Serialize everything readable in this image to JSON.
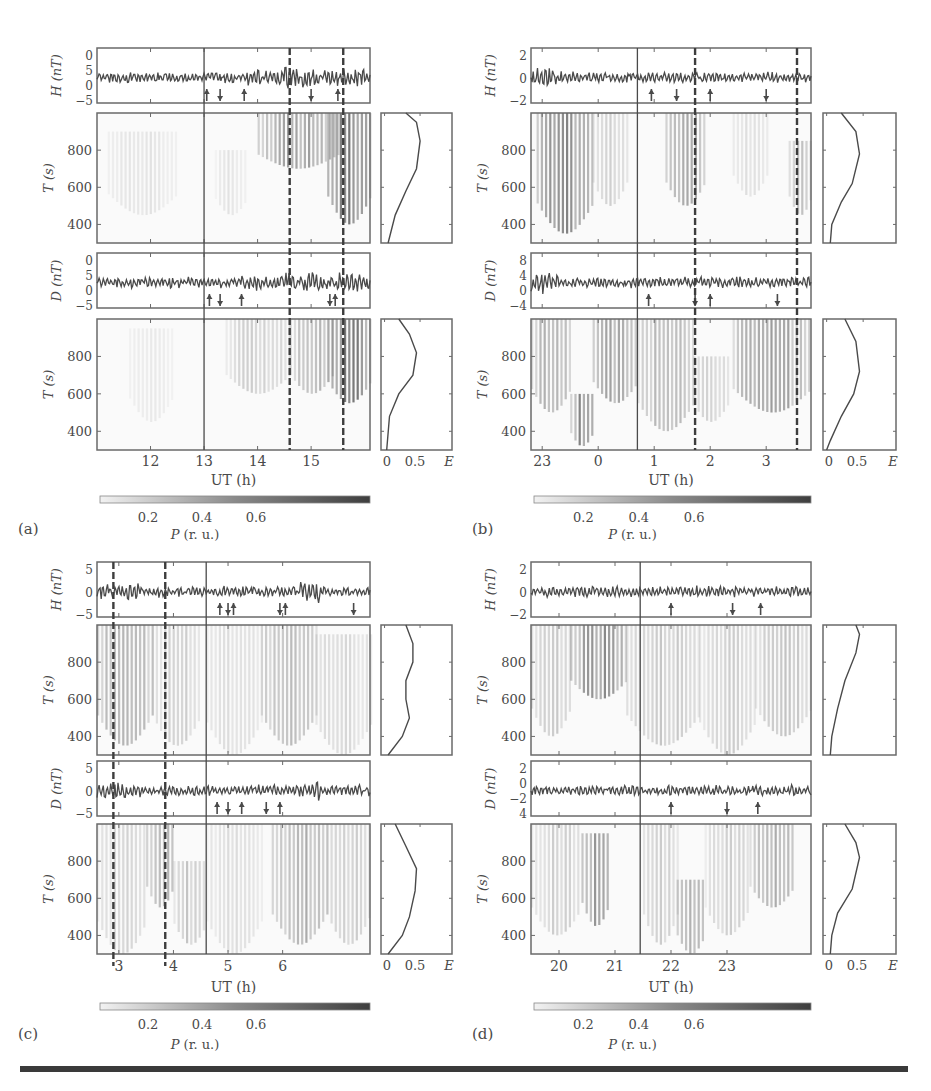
{
  "figure": {
    "caption_visible": "",
    "colors": {
      "axis": "#6a6a6a",
      "trace": "#4a4a4a",
      "dashed": "#3d3d3d",
      "spec_dark": "#555555",
      "spec_light": "#f2f2f2",
      "rule": "#3a3a3a"
    }
  },
  "chart_data": [
    {
      "panel": "a",
      "type": "heatmap",
      "label": "(a)",
      "h_strip": {
        "ylabel": "H (nT)",
        "yticks": [
          "0",
          "5",
          "0",
          "−5"
        ]
      },
      "d_strip": {
        "ylabel": "D (nT)",
        "yticks": [
          "0",
          "5",
          "0",
          "−5"
        ]
      },
      "spectrogram": {
        "ylabel": "T (s)",
        "yticks": [
          800,
          600,
          400
        ],
        "ylim": [
          300,
          1000
        ]
      },
      "xlabel": "UT (h)",
      "xticks": [
        "12",
        "13",
        "14",
        "15"
      ],
      "xrange": [
        11.0,
        16.1
      ],
      "xtick_values": [
        12,
        13,
        14,
        15
      ],
      "solid_line": 13.0,
      "dashed_lines": [
        14.6,
        15.6
      ],
      "arrows_H": [
        {
          "x": 13.05,
          "dir": "up"
        },
        {
          "x": 13.3,
          "dir": "down"
        },
        {
          "x": 13.75,
          "dir": "up"
        },
        {
          "x": 15.0,
          "dir": "down"
        },
        {
          "x": 15.5,
          "dir": "up"
        }
      ],
      "arrows_D": [
        {
          "x": 13.1,
          "dir": "up"
        },
        {
          "x": 13.3,
          "dir": "down"
        },
        {
          "x": 13.7,
          "dir": "up"
        },
        {
          "x": 15.35,
          "dir": "down"
        },
        {
          "x": 15.45,
          "dir": "up"
        }
      ],
      "E_profile_1": {
        "xticks": [
          "0",
          "0.5",
          "E"
        ],
        "curve": [
          [
            0.35,
            1000
          ],
          [
            0.5,
            950
          ],
          [
            0.55,
            850
          ],
          [
            0.5,
            700
          ],
          [
            0.35,
            580
          ],
          [
            0.2,
            450
          ],
          [
            0.1,
            300
          ]
        ]
      },
      "E_profile_2": {
        "xticks": [
          "0",
          "0.5",
          "E"
        ],
        "curve": [
          [
            0.25,
            1000
          ],
          [
            0.4,
            920
          ],
          [
            0.5,
            820
          ],
          [
            0.45,
            700
          ],
          [
            0.25,
            600
          ],
          [
            0.12,
            480
          ],
          [
            0.08,
            300
          ]
        ]
      },
      "colorbar": {
        "label": "P (r. u.)",
        "ticks": [
          "0.2",
          "0.4",
          "0.6"
        ]
      },
      "spec1_blobs": [
        [
          14.0,
          15.5,
          700,
          1000,
          0.6
        ],
        [
          15.3,
          16.1,
          400,
          1000,
          0.85
        ],
        [
          11.2,
          12.5,
          450,
          900,
          0.15
        ],
        [
          13.2,
          13.8,
          450,
          800,
          0.15
        ]
      ],
      "spec2_blobs": [
        [
          13.4,
          14.6,
          600,
          1000,
          0.3
        ],
        [
          14.6,
          15.4,
          600,
          1000,
          0.45
        ],
        [
          15.3,
          16.1,
          550,
          1000,
          0.9
        ],
        [
          11.6,
          12.4,
          450,
          950,
          0.12
        ]
      ]
    },
    {
      "panel": "b",
      "type": "heatmap",
      "label": "(b)",
      "h_strip": {
        "ylabel": "H (nT)",
        "yticks": [
          "2",
          "0",
          "−2"
        ]
      },
      "d_strip": {
        "ylabel": "D (nT)",
        "yticks": [
          "8",
          "4",
          "0",
          "−4"
        ]
      },
      "spectrogram": {
        "ylabel": "T (s)",
        "yticks": [
          800,
          600,
          400
        ],
        "ylim": [
          300,
          1000
        ]
      },
      "xlabel": "UT (h)",
      "xticks": [
        "23",
        "0",
        "1",
        "2",
        "3"
      ],
      "xrange": [
        22.8,
        27.8
      ],
      "xtick_values": [
        23,
        24,
        25,
        26,
        27
      ],
      "solid_line": 24.7,
      "dashed_lines": [
        25.73,
        27.55
      ],
      "arrows_H": [
        {
          "x": 24.95,
          "dir": "up"
        },
        {
          "x": 25.4,
          "dir": "down"
        },
        {
          "x": 26.0,
          "dir": "up"
        },
        {
          "x": 27.0,
          "dir": "down"
        }
      ],
      "arrows_D": [
        {
          "x": 24.9,
          "dir": "up"
        },
        {
          "x": 25.73,
          "dir": "down"
        },
        {
          "x": 26.0,
          "dir": "up"
        },
        {
          "x": 27.2,
          "dir": "down"
        }
      ],
      "E_profile_1": {
        "xticks": [
          "0",
          "0.5",
          "E"
        ],
        "curve": [
          [
            0.25,
            1000
          ],
          [
            0.45,
            900
          ],
          [
            0.5,
            780
          ],
          [
            0.4,
            620
          ],
          [
            0.25,
            520
          ],
          [
            0.12,
            400
          ],
          [
            0.1,
            300
          ]
        ]
      },
      "E_profile_2": {
        "xticks": [
          "0",
          "0.5",
          "E"
        ],
        "curve": [
          [
            0.3,
            1000
          ],
          [
            0.45,
            880
          ],
          [
            0.5,
            720
          ],
          [
            0.42,
            600
          ],
          [
            0.25,
            480
          ],
          [
            0.1,
            350
          ],
          [
            0.05,
            300
          ]
        ]
      },
      "colorbar": {
        "label": "P (r. u.)",
        "ticks": [
          "0.2",
          "0.4",
          "0.6"
        ]
      },
      "spec1_blobs": [
        [
          22.9,
          23.9,
          350,
          1000,
          0.75
        ],
        [
          23.9,
          24.5,
          500,
          1000,
          0.3
        ],
        [
          25.2,
          25.9,
          500,
          1000,
          0.55
        ],
        [
          26.4,
          27.0,
          550,
          1000,
          0.2
        ],
        [
          27.4,
          27.8,
          450,
          850,
          0.45
        ]
      ],
      "spec2_blobs": [
        [
          22.8,
          23.5,
          500,
          1000,
          0.55
        ],
        [
          23.5,
          23.9,
          320,
          600,
          0.8
        ],
        [
          23.9,
          24.7,
          550,
          1000,
          0.6
        ],
        [
          24.7,
          25.7,
          400,
          1000,
          0.45
        ],
        [
          25.7,
          26.3,
          450,
          800,
          0.3
        ],
        [
          26.4,
          27.8,
          500,
          1000,
          0.6
        ]
      ]
    },
    {
      "panel": "c",
      "type": "heatmap",
      "label": "(c)",
      "h_strip": {
        "ylabel": "H (nT)",
        "yticks": [
          "5",
          "0",
          "−5"
        ]
      },
      "d_strip": {
        "ylabel": "D (nT)",
        "yticks": [
          "5",
          "0",
          "−5"
        ]
      },
      "spectrogram": {
        "ylabel": "T (s)",
        "yticks": [
          800,
          600,
          400
        ],
        "ylim": [
          300,
          1000
        ]
      },
      "xlabel": "UT (h)",
      "xticks": [
        "3",
        "4",
        "5",
        "6"
      ],
      "xrange": [
        2.6,
        7.6
      ],
      "xtick_values": [
        3,
        4,
        5,
        6
      ],
      "solid_line": 4.6,
      "dashed_lines": [
        2.9,
        3.85
      ],
      "arrows_H": [
        {
          "x": 4.85,
          "dir": "up"
        },
        {
          "x": 5.0,
          "dir": "down"
        },
        {
          "x": 5.1,
          "dir": "up"
        },
        {
          "x": 5.95,
          "dir": "down"
        },
        {
          "x": 6.05,
          "dir": "up"
        },
        {
          "x": 7.3,
          "dir": "down"
        }
      ],
      "arrows_D": [
        {
          "x": 4.8,
          "dir": "up"
        },
        {
          "x": 5.0,
          "dir": "down"
        },
        {
          "x": 5.25,
          "dir": "up"
        },
        {
          "x": 5.7,
          "dir": "down"
        },
        {
          "x": 5.95,
          "dir": "up"
        }
      ],
      "E_profile_1": {
        "xticks": [
          "0",
          "0.5",
          "E"
        ],
        "curve": [
          [
            0.35,
            1000
          ],
          [
            0.45,
            900
          ],
          [
            0.45,
            800
          ],
          [
            0.35,
            700
          ],
          [
            0.35,
            600
          ],
          [
            0.4,
            500
          ],
          [
            0.3,
            400
          ],
          [
            0.1,
            300
          ]
        ]
      },
      "E_profile_2": {
        "xticks": [
          "0",
          "0.5",
          "E"
        ],
        "curve": [
          [
            0.2,
            1000
          ],
          [
            0.35,
            880
          ],
          [
            0.5,
            760
          ],
          [
            0.48,
            640
          ],
          [
            0.4,
            500
          ],
          [
            0.3,
            400
          ],
          [
            0.1,
            300
          ]
        ]
      },
      "colorbar": {
        "label": "P (r. u.)",
        "ticks": [
          "0.2",
          "0.4",
          "0.6"
        ]
      },
      "spec1_blobs": [
        [
          2.6,
          3.6,
          350,
          1000,
          0.6
        ],
        [
          3.6,
          4.5,
          350,
          1000,
          0.3
        ],
        [
          4.6,
          5.6,
          300,
          1000,
          0.2
        ],
        [
          5.6,
          6.6,
          350,
          1000,
          0.45
        ],
        [
          6.6,
          7.6,
          300,
          950,
          0.25
        ]
      ],
      "spec2_blobs": [
        [
          2.6,
          3.5,
          300,
          1000,
          0.25
        ],
        [
          3.5,
          4.0,
          550,
          1000,
          0.55
        ],
        [
          4.0,
          4.6,
          350,
          800,
          0.35
        ],
        [
          4.6,
          5.6,
          300,
          1000,
          0.2
        ],
        [
          5.8,
          6.8,
          350,
          1000,
          0.5
        ],
        [
          6.8,
          7.6,
          350,
          1000,
          0.3
        ]
      ]
    },
    {
      "panel": "d",
      "type": "heatmap",
      "label": "(d)",
      "h_strip": {
        "ylabel": "H (nT)",
        "yticks": [
          "2",
          "0",
          "−2"
        ]
      },
      "d_strip": {
        "ylabel": "D (nT)",
        "yticks": [
          "2",
          "0",
          "−2",
          "4"
        ]
      },
      "spectrogram": {
        "ylabel": "T (s)",
        "yticks": [
          800,
          600,
          400
        ],
        "ylim": [
          300,
          1000
        ]
      },
      "xlabel": "UT (h)",
      "xticks": [
        "20",
        "21",
        "22",
        "23"
      ],
      "xrange": [
        19.5,
        24.5
      ],
      "xtick_values": [
        20,
        21,
        22,
        23
      ],
      "solid_line": 21.45,
      "dashed_lines": [],
      "arrows_H": [
        {
          "x": 22.0,
          "dir": "up"
        },
        {
          "x": 23.1,
          "dir": "down"
        },
        {
          "x": 23.6,
          "dir": "up"
        }
      ],
      "arrows_D": [
        {
          "x": 22.0,
          "dir": "up"
        },
        {
          "x": 23.0,
          "dir": "down"
        },
        {
          "x": 23.55,
          "dir": "up"
        }
      ],
      "E_profile_1": {
        "xticks": [
          "0",
          "0.5",
          "E"
        ],
        "curve": [
          [
            0.45,
            1000
          ],
          [
            0.5,
            950
          ],
          [
            0.45,
            850
          ],
          [
            0.3,
            700
          ],
          [
            0.2,
            550
          ],
          [
            0.12,
            400
          ],
          [
            0.1,
            300
          ]
        ]
      },
      "E_profile_2": {
        "xticks": [
          "0",
          "0.5",
          "E"
        ],
        "curve": [
          [
            0.3,
            1000
          ],
          [
            0.45,
            900
          ],
          [
            0.5,
            820
          ],
          [
            0.4,
            650
          ],
          [
            0.2,
            520
          ],
          [
            0.12,
            400
          ],
          [
            0.1,
            300
          ]
        ]
      },
      "colorbar": {
        "label": "P (r. u.)",
        "ticks": [
          "0.2",
          "0.4",
          "0.6"
        ]
      },
      "spec1_blobs": [
        [
          19.5,
          20.2,
          400,
          1000,
          0.35
        ],
        [
          20.2,
          21.2,
          600,
          1000,
          0.75
        ],
        [
          21.2,
          22.5,
          350,
          1000,
          0.35
        ],
        [
          22.5,
          23.5,
          300,
          1000,
          0.3
        ],
        [
          23.5,
          24.5,
          400,
          1000,
          0.35
        ]
      ],
      "spec2_blobs": [
        [
          19.5,
          20.4,
          400,
          1000,
          0.3
        ],
        [
          20.4,
          20.9,
          450,
          950,
          0.65
        ],
        [
          21.5,
          22.1,
          350,
          1000,
          0.3
        ],
        [
          22.1,
          22.6,
          300,
          700,
          0.55
        ],
        [
          22.6,
          23.4,
          400,
          1000,
          0.3
        ],
        [
          23.4,
          24.2,
          550,
          1000,
          0.55
        ]
      ]
    }
  ]
}
